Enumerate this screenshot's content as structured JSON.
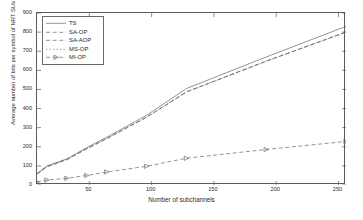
{
  "chart_data": {
    "type": "line",
    "title": "",
    "xlabel": "Number of subchannels",
    "ylabel": "Average number of bits per symbol of NRT SUs",
    "xlim": [
      8,
      256
    ],
    "ylim": [
      0,
      900
    ],
    "xticks": [
      50,
      100,
      150,
      200,
      250
    ],
    "yticks": [
      0,
      100,
      200,
      300,
      400,
      500,
      600,
      700,
      800,
      900
    ],
    "grid": false,
    "legend_position": "upper-left",
    "x": [
      8,
      16,
      32,
      48,
      64,
      96,
      128,
      192,
      256
    ],
    "series": [
      {
        "name": "TS",
        "style": "solid",
        "marker": "none",
        "values": [
          60,
          100,
          137,
          196,
          250,
          365,
          505,
          670,
          830
        ]
      },
      {
        "name": "SA-OP",
        "style": "dashed",
        "marker": "none",
        "values": [
          58,
          96,
          133,
          190,
          243,
          355,
          487,
          648,
          800
        ]
      },
      {
        "name": "SA-AOP",
        "style": "dashed",
        "marker": "none",
        "values": [
          58,
          96,
          133,
          190,
          243,
          355,
          487,
          648,
          800
        ]
      },
      {
        "name": "MS-OP",
        "style": "dotted",
        "marker": "none",
        "values": [
          58,
          96,
          133,
          190,
          243,
          355,
          487,
          648,
          800
        ]
      },
      {
        "name": "MI-OP",
        "style": "dashed",
        "marker": "triangle-right",
        "values": [
          16,
          26,
          35,
          50,
          68,
          98,
          140,
          186,
          228
        ]
      }
    ],
    "yticklabels": [
      "0",
      "100",
      "200",
      "300",
      "400",
      "500",
      "600",
      "700",
      "800",
      "900"
    ],
    "xticklabels": [
      "50",
      "100",
      "150",
      "200",
      "250"
    ]
  },
  "legend": {
    "entries": [
      {
        "label": "TS"
      },
      {
        "label": "SA-OP"
      },
      {
        "label": "SA-AOP"
      },
      {
        "label": "MS-OP"
      },
      {
        "label": "MI-OP"
      }
    ]
  },
  "colors": {
    "axis": "#5a5a5a",
    "text": "#2b2b2b",
    "line": "#707070",
    "background": "#ffffff"
  }
}
